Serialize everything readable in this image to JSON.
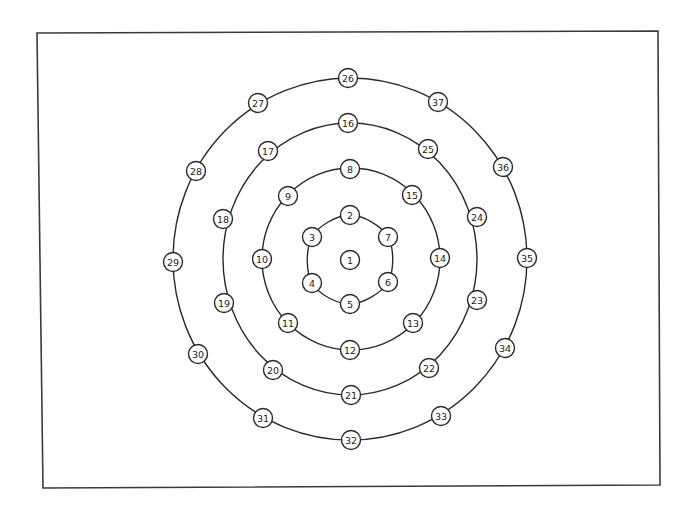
{
  "diagram": {
    "type": "concentric-ring-node-layout",
    "center": {
      "x": 350,
      "y": 260
    },
    "frame": {
      "points": [
        [
          37,
          33
        ],
        [
          658,
          31
        ],
        [
          660,
          485
        ],
        [
          43,
          488
        ]
      ]
    },
    "rings": [
      {
        "id": "ring-1",
        "type": "polygon",
        "nodes": [
          2,
          7,
          6,
          5,
          4,
          3
        ]
      },
      {
        "id": "ring-2",
        "type": "ellipse",
        "cx": 351,
        "cy": 259,
        "rx": 89,
        "ry": 91,
        "nodes": [
          8,
          15,
          14,
          13,
          12,
          11,
          10,
          9
        ]
      },
      {
        "id": "ring-3",
        "type": "ellipse",
        "cx": 350,
        "cy": 259,
        "rx": 127,
        "ry": 136,
        "nodes": [
          16,
          25,
          24,
          23,
          22,
          21,
          20,
          19,
          18,
          17
        ]
      },
      {
        "id": "ring-4",
        "type": "ellipse",
        "cx": 350,
        "cy": 259,
        "rx": 177,
        "ry": 181,
        "nodes": [
          26,
          37,
          36,
          35,
          34,
          33,
          32,
          31,
          30,
          29,
          28,
          27
        ]
      }
    ],
    "nodes": [
      {
        "label": "1",
        "x": 350,
        "y": 260
      },
      {
        "label": "2",
        "x": 350,
        "y": 215
      },
      {
        "label": "3",
        "x": 312,
        "y": 237
      },
      {
        "label": "4",
        "x": 312,
        "y": 283
      },
      {
        "label": "5",
        "x": 350,
        "y": 304
      },
      {
        "label": "6",
        "x": 388,
        "y": 282
      },
      {
        "label": "7",
        "x": 388,
        "y": 237
      },
      {
        "label": "8",
        "x": 350,
        "y": 169
      },
      {
        "label": "9",
        "x": 288,
        "y": 196
      },
      {
        "label": "10",
        "x": 262,
        "y": 259
      },
      {
        "label": "11",
        "x": 288,
        "y": 323
      },
      {
        "label": "12",
        "x": 350,
        "y": 350
      },
      {
        "label": "13",
        "x": 413,
        "y": 323
      },
      {
        "label": "14",
        "x": 440,
        "y": 258
      },
      {
        "label": "15",
        "x": 412,
        "y": 195
      },
      {
        "label": "16",
        "x": 348,
        "y": 123
      },
      {
        "label": "17",
        "x": 268,
        "y": 151
      },
      {
        "label": "18",
        "x": 223,
        "y": 219
      },
      {
        "label": "19",
        "x": 224,
        "y": 303
      },
      {
        "label": "20",
        "x": 273,
        "y": 370
      },
      {
        "label": "21",
        "x": 351,
        "y": 395
      },
      {
        "label": "22",
        "x": 429,
        "y": 368
      },
      {
        "label": "23",
        "x": 477,
        "y": 300
      },
      {
        "label": "24",
        "x": 477,
        "y": 217
      },
      {
        "label": "25",
        "x": 428,
        "y": 149
      },
      {
        "label": "26",
        "x": 348,
        "y": 78
      },
      {
        "label": "27",
        "x": 258,
        "y": 103
      },
      {
        "label": "28",
        "x": 196,
        "y": 171
      },
      {
        "label": "29",
        "x": 173,
        "y": 262
      },
      {
        "label": "30",
        "x": 198,
        "y": 354
      },
      {
        "label": "31",
        "x": 263,
        "y": 418
      },
      {
        "label": "32",
        "x": 351,
        "y": 440
      },
      {
        "label": "33",
        "x": 441,
        "y": 416
      },
      {
        "label": "34",
        "x": 505,
        "y": 348
      },
      {
        "label": "35",
        "x": 527,
        "y": 258
      },
      {
        "label": "36",
        "x": 503,
        "y": 167
      },
      {
        "label": "37",
        "x": 438,
        "y": 102
      }
    ],
    "node_radius": 9.5,
    "colors": {
      "stroke": "#2a2a2a",
      "background": "#ffffff",
      "text": "#222222"
    }
  }
}
